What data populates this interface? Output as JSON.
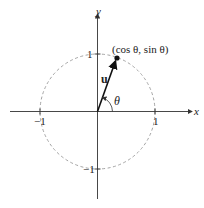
{
  "diagram": {
    "axes": {
      "x_label": "x",
      "y_label": "y"
    },
    "ticks": {
      "x_pos": "1",
      "x_neg": "−1",
      "y_pos": "1",
      "y_neg": "−1"
    },
    "vector_label": "u",
    "angle_label": "θ",
    "point_label": "(cos θ, sin θ)",
    "colors": {
      "axis": "#333333",
      "circle": "#9a9a9a",
      "vector": "#111111"
    }
  }
}
